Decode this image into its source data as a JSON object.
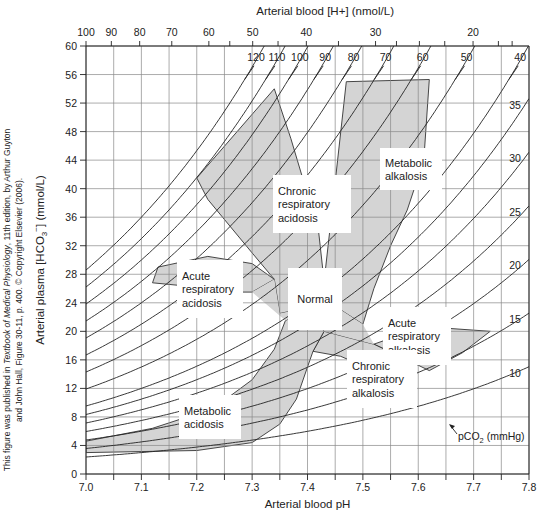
{
  "chart_data": {
    "type": "line",
    "title": "",
    "xlabel": "Arterial blood pH",
    "ylabel": "Arterial plasma [HCO3-] (mmol/L)",
    "ylabel_parts": {
      "pre": "Arterial plasma [HCO",
      "sub": "3",
      "sup": "−",
      "post": "] (mmol/L)"
    },
    "top_xlabel": "Arterial blood [H+] (nmol/L)",
    "xlim": [
      7.0,
      7.8
    ],
    "ylim": [
      0,
      60
    ],
    "grid": true,
    "x_ticks": [
      7.0,
      7.05,
      7.1,
      7.15,
      7.2,
      7.25,
      7.3,
      7.35,
      7.4,
      7.45,
      7.5,
      7.55,
      7.6,
      7.65,
      7.7,
      7.75,
      7.8
    ],
    "x_tick_labels": [
      "7.0",
      "7.1",
      "7.2",
      "7.3",
      "7.4",
      "7.5",
      "7.6",
      "7.7",
      "7.8"
    ],
    "y_ticks": [
      0,
      4,
      8,
      12,
      16,
      20,
      24,
      28,
      32,
      36,
      40,
      44,
      48,
      52,
      56,
      60
    ],
    "top_ticks_h": [
      100,
      90,
      80,
      70,
      60,
      55,
      50,
      45,
      40,
      35,
      30,
      27.5,
      25,
      22.5,
      20,
      18,
      17
    ],
    "top_tick_labels": [
      "100",
      "90",
      "80",
      "70",
      "60",
      "50",
      "40",
      "30",
      "20"
    ],
    "series_label": {
      "pre": "pCO",
      "sub": "2",
      "post": " (mmHg)"
    },
    "series": [
      {
        "name": "120",
        "pco2": 120
      },
      {
        "name": "110",
        "pco2": 110
      },
      {
        "name": "100",
        "pco2": 100
      },
      {
        "name": "90",
        "pco2": 90
      },
      {
        "name": "80",
        "pco2": 80
      },
      {
        "name": "70",
        "pco2": 70
      },
      {
        "name": "60",
        "pco2": 60
      },
      {
        "name": "50",
        "pco2": 50
      },
      {
        "name": "40",
        "pco2": 40
      },
      {
        "name": "35",
        "pco2": 35
      },
      {
        "name": "30",
        "pco2": 30
      },
      {
        "name": "25",
        "pco2": 25
      },
      {
        "name": "20",
        "pco2": 20
      },
      {
        "name": "15",
        "pco2": 15
      },
      {
        "name": "10",
        "pco2": 10
      }
    ],
    "regions": [
      {
        "name": "Chronic respiratory acidosis",
        "label": [
          "Chronic",
          "respiratory",
          "acidosis"
        ],
        "points": [
          [
            7.2,
            41.5
          ],
          [
            7.34,
            54
          ],
          [
            7.37,
            47
          ],
          [
            7.42,
            34
          ],
          [
            7.43,
            27
          ],
          [
            7.44,
            24
          ],
          [
            7.35,
            22.5
          ],
          [
            7.34,
            27.3
          ],
          [
            7.3,
            31
          ],
          [
            7.22,
            38.5
          ]
        ]
      },
      {
        "name": "Metabolic alkalosis",
        "label": [
          "Metabolic",
          "alkalosis"
        ],
        "points": [
          [
            7.47,
            55
          ],
          [
            7.62,
            55.3
          ],
          [
            7.61,
            44
          ],
          [
            7.58,
            37
          ],
          [
            7.55,
            32
          ],
          [
            7.52,
            26
          ],
          [
            7.5,
            21
          ],
          [
            7.44,
            24
          ],
          [
            7.43,
            27
          ],
          [
            7.44,
            34
          ]
        ]
      },
      {
        "name": "Normal",
        "label": [
          "Normal"
        ],
        "points": []
      },
      {
        "name": "Acute respiratory acidosis",
        "label": [
          "Acute",
          "respiratory",
          "acidosis"
        ],
        "points": [
          [
            7.13,
            29
          ],
          [
            7.22,
            30.5
          ],
          [
            7.3,
            29.5
          ],
          [
            7.34,
            27.3
          ],
          [
            7.3,
            25.5
          ],
          [
            7.24,
            25.5
          ],
          [
            7.2,
            26.2
          ],
          [
            7.12,
            26.8
          ]
        ]
      },
      {
        "name": "Acute respiratory alkalosis",
        "label": [
          "Acute",
          "respiratory",
          "alkalosis"
        ],
        "points": [
          [
            7.56,
            19.3
          ],
          [
            7.64,
            20.5
          ],
          [
            7.73,
            20
          ],
          [
            7.68,
            17
          ],
          [
            7.62,
            14.5
          ],
          [
            7.58,
            16
          ],
          [
            7.52,
            18.2
          ]
        ]
      },
      {
        "name": "Chronic respiratory alkalosis",
        "label": [
          "Chronic",
          "respiratory",
          "alkalosis"
        ],
        "points": [
          [
            7.43,
            20
          ],
          [
            7.52,
            18.2
          ],
          [
            7.58,
            16
          ],
          [
            7.52,
            14.5
          ],
          [
            7.46,
            16.5
          ],
          [
            7.41,
            17.2
          ]
        ]
      },
      {
        "name": "Metabolic acidosis",
        "label": [
          "Metabolic",
          "acidosis"
        ],
        "points": [
          [
            7.0,
            4.6
          ],
          [
            7.12,
            6.4
          ],
          [
            7.23,
            9.2
          ],
          [
            7.3,
            13.2
          ],
          [
            7.34,
            17.5
          ],
          [
            7.36,
            21.5
          ],
          [
            7.4,
            23
          ],
          [
            7.43,
            20
          ],
          [
            7.41,
            17.2
          ],
          [
            7.4,
            15
          ],
          [
            7.38,
            10.5
          ],
          [
            7.35,
            7
          ],
          [
            7.3,
            4.4
          ],
          [
            7.2,
            3.3
          ],
          [
            7.0,
            3.0
          ]
        ]
      }
    ]
  }
}
